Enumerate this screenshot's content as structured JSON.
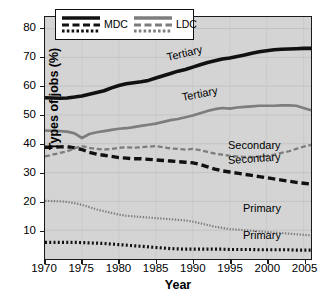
{
  "chart_data": {
    "type": "line",
    "title": "",
    "xlabel": "Year",
    "ylabel": "Types of jobs (%)",
    "xlim": [
      1970,
      2006
    ],
    "ylim": [
      0,
      84
    ],
    "yticks": [
      10,
      20,
      30,
      40,
      50,
      60,
      70,
      80
    ],
    "xticks": [
      1970,
      1975,
      1980,
      1985,
      1990,
      1995,
      2000,
      2005
    ],
    "grid": true,
    "legend_position": "top-left-inside",
    "legend": [
      {
        "label": "MDC",
        "color": "#111111"
      },
      {
        "label": "LDC",
        "color": "#7d7d7d"
      }
    ],
    "x": [
      1970,
      1971,
      1972,
      1973,
      1974,
      1975,
      1976,
      1977,
      1978,
      1979,
      1980,
      1981,
      1982,
      1983,
      1984,
      1985,
      1986,
      1987,
      1988,
      1989,
      1990,
      1991,
      1992,
      1993,
      1994,
      1995,
      1996,
      1997,
      1998,
      1999,
      2000,
      2001,
      2002,
      2003,
      2004,
      2005,
      2006
    ],
    "series": [
      {
        "name": "MDC Tertiary",
        "group": "MDC",
        "category": "Tertiary",
        "color": "#111111",
        "style": "solid",
        "label": "Tertiary",
        "values": [
          56.0,
          55.9,
          55.8,
          55.9,
          56.2,
          56.6,
          57.2,
          57.8,
          58.4,
          59.4,
          60.2,
          60.8,
          61.2,
          61.5,
          62.0,
          62.8,
          63.6,
          64.4,
          65.2,
          65.8,
          66.6,
          67.4,
          68.2,
          68.8,
          69.4,
          69.8,
          70.3,
          70.8,
          71.4,
          71.9,
          72.3,
          72.6,
          72.8,
          72.9,
          73.0,
          73.1,
          73.1
        ]
      },
      {
        "name": "LDC Tertiary",
        "group": "LDC",
        "category": "Tertiary",
        "color": "#7d7d7d",
        "style": "solid",
        "label": "Tertiary",
        "values": [
          44.6,
          44.5,
          44.4,
          44.2,
          43.6,
          42.0,
          43.4,
          44.0,
          44.4,
          44.8,
          45.2,
          45.4,
          45.8,
          46.2,
          46.6,
          47.0,
          47.6,
          48.2,
          48.6,
          49.2,
          49.8,
          50.6,
          51.4,
          52.0,
          52.4,
          52.2,
          52.6,
          52.8,
          53.0,
          53.2,
          53.2,
          53.2,
          53.3,
          53.3,
          53.2,
          52.4,
          51.6
        ]
      },
      {
        "name": "MDC Secondary",
        "group": "MDC",
        "category": "Secondary",
        "color": "#111111",
        "style": "dashed",
        "label": "Secondary",
        "values": [
          38.8,
          38.8,
          38.9,
          39.0,
          38.6,
          38.0,
          37.0,
          36.4,
          36.0,
          35.6,
          35.2,
          35.0,
          34.8,
          34.8,
          34.6,
          34.4,
          34.2,
          34.0,
          33.8,
          33.6,
          33.4,
          32.8,
          32.0,
          31.2,
          30.6,
          30.2,
          29.8,
          29.4,
          29.0,
          28.6,
          28.2,
          27.8,
          27.4,
          27.0,
          26.6,
          26.3,
          26.0
        ]
      },
      {
        "name": "LDC Secondary",
        "group": "LDC",
        "category": "Secondary",
        "color": "#7d7d7d",
        "style": "dashed",
        "label": "Secondary",
        "values": [
          35.6,
          36.2,
          36.8,
          37.4,
          38.4,
          39.2,
          38.6,
          38.2,
          38.0,
          38.2,
          38.6,
          38.8,
          38.6,
          38.8,
          39.0,
          39.2,
          38.8,
          38.4,
          38.2,
          38.0,
          38.2,
          37.8,
          37.2,
          36.6,
          36.2,
          35.8,
          35.6,
          35.4,
          35.4,
          35.6,
          35.8,
          36.2,
          36.8,
          37.4,
          38.2,
          39.0,
          39.6
        ]
      },
      {
        "name": "LDC Primary",
        "group": "LDC",
        "category": "Primary",
        "color": "#7d7d7d",
        "style": "dotted",
        "label": "Primary",
        "values": [
          20.2,
          20.1,
          20.0,
          19.8,
          19.4,
          18.8,
          18.0,
          17.2,
          16.6,
          16.0,
          15.4,
          15.0,
          14.8,
          14.6,
          14.4,
          14.2,
          14.0,
          13.8,
          13.6,
          13.4,
          13.0,
          12.4,
          11.8,
          11.2,
          10.8,
          10.4,
          10.2,
          10.0,
          9.8,
          9.6,
          9.4,
          9.2,
          9.0,
          8.8,
          8.6,
          8.4,
          8.2
        ]
      },
      {
        "name": "MDC Primary",
        "group": "MDC",
        "category": "Primary",
        "color": "#111111",
        "style": "dotted",
        "label": "Primary",
        "values": [
          5.8,
          5.8,
          5.8,
          5.8,
          5.8,
          5.7,
          5.6,
          5.5,
          5.4,
          5.2,
          5.0,
          4.8,
          4.6,
          4.4,
          4.2,
          4.0,
          3.8,
          3.6,
          3.5,
          3.4,
          3.4,
          3.4,
          3.4,
          3.4,
          3.4,
          3.3,
          3.3,
          3.3,
          3.3,
          3.2,
          3.2,
          3.2,
          3.2,
          3.2,
          3.1,
          3.1,
          3.1
        ]
      }
    ],
    "annotations": [
      {
        "text": "Tertiary",
        "for": "MDC Tertiary",
        "x": 167,
        "y": 52,
        "rotate": -13
      },
      {
        "text": "Tertiary",
        "for": "LDC Tertiary",
        "x": 182,
        "y": 92,
        "rotate": -11
      },
      {
        "text": "Secondary",
        "for": "LDC Secondary",
        "x": 228,
        "y": 140,
        "rotate": 0
      },
      {
        "text": "Secondary",
        "for": "MDC Secondary",
        "x": 228,
        "y": 155,
        "rotate": -4
      },
      {
        "text": "Primary",
        "for": "LDC Primary",
        "x": 243,
        "y": 203,
        "rotate": 0
      },
      {
        "text": "Primary",
        "for": "MDC Primary",
        "x": 243,
        "y": 230,
        "rotate": 0
      }
    ]
  }
}
